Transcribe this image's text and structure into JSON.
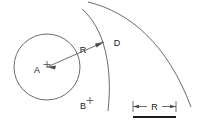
{
  "figure": {
    "type": "technical-line-diagram",
    "background_color": "#ffffff",
    "line_color": "#4a4a4a",
    "label_color": "#1a1a1a"
  },
  "labels": {
    "center_a": "A",
    "point_b": "B",
    "arc_d": "D",
    "radius_dimension": "R",
    "scale_bar": "R"
  },
  "geometry": {
    "circle": {
      "name": "circle-a",
      "center_x": 47,
      "center_y": 67,
      "radius": 33
    },
    "marker_a": {
      "x": 47,
      "y": 67,
      "glyph": "+"
    },
    "marker_b": {
      "x": 90,
      "y": 103,
      "glyph": "+"
    },
    "radius_arrow": {
      "from_x": 47,
      "from_y": 67,
      "to_x": 104,
      "to_y": 42,
      "label_x": 83,
      "label_y": 52
    },
    "inner_arc": {
      "name": "arc-d",
      "start_x": 82,
      "start_y": 9,
      "end_x": 108,
      "end_y": 111,
      "sweep_control_x": 130,
      "sweep_control_y": 60
    },
    "outer_arc": {
      "name": "arc-outer",
      "start_x": 88,
      "start_y": 2,
      "end_x": 191,
      "end_y": 107,
      "sweep_control_x": 175,
      "sweep_control_y": 30
    },
    "scale": {
      "left_x": 133,
      "right_x": 176,
      "dim_y": 107,
      "bar_y": 117,
      "label_x": 154,
      "label_y": 105
    }
  }
}
